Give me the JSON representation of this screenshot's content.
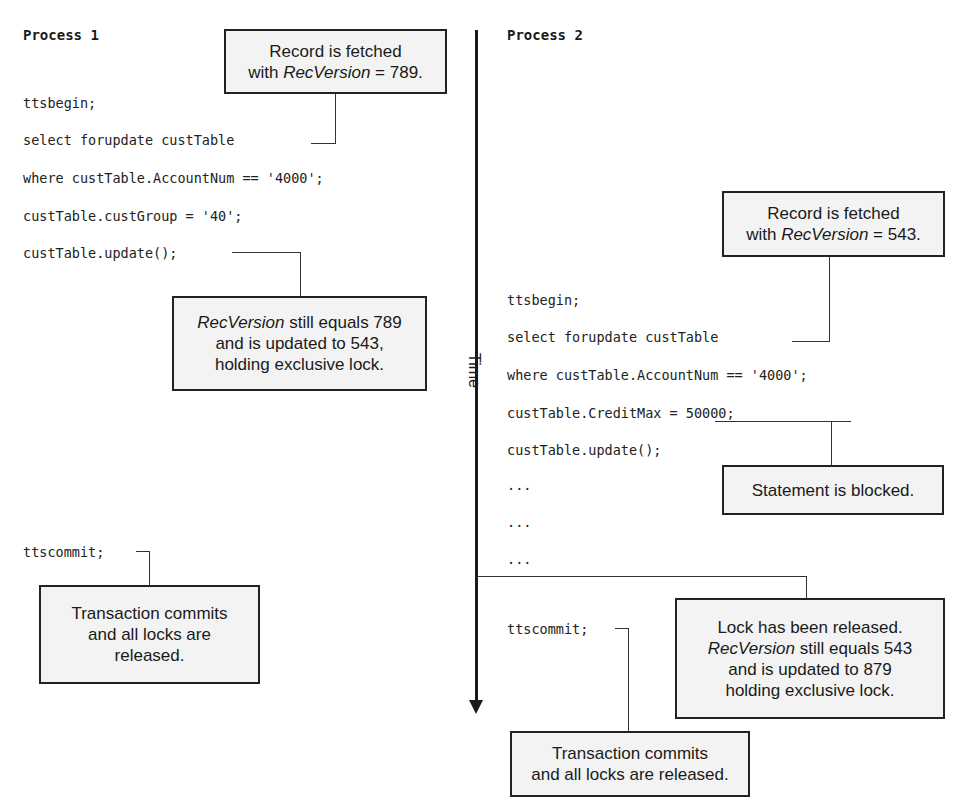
{
  "diagram": {
    "type": "sequence-timeline",
    "time_axis": {
      "label": "Time",
      "direction": "down"
    },
    "process1": {
      "heading": "Process 1",
      "code": [
        "ttsbegin;",
        "select forupdate custTable",
        "where custTable.AccountNum == '4000';",
        "custTable.custGroup = '40';",
        "custTable.update();",
        "ttscommit;"
      ],
      "callouts": {
        "fetched": {
          "line1": "Record is fetched",
          "line2_pre": "with ",
          "line2_em": "RecVersion",
          "line2_post": " = 789."
        },
        "updated": {
          "line1_em": "RecVersion",
          "line1_post": " still equals 789",
          "line2": "and is updated to 543,",
          "line3": "holding exclusive lock."
        },
        "commit": {
          "line1": "Transaction commits",
          "line2": "and all locks are",
          "line3": "released."
        }
      }
    },
    "process2": {
      "heading": "Process 2",
      "code": [
        "ttsbegin;",
        "select forupdate custTable",
        "where custTable.AccountNum == '4000';",
        "custTable.CreditMax = 50000;",
        "custTable.update();",
        "...",
        "...",
        "...",
        "ttscommit;"
      ],
      "callouts": {
        "fetched": {
          "line1": "Record is fetched",
          "line2_pre": "with ",
          "line2_em": "RecVersion",
          "line2_post": " = 543."
        },
        "blocked": {
          "line1": "Statement is blocked."
        },
        "released": {
          "line1": "Lock has been released.",
          "line2_em": "RecVersion",
          "line2_post": " still equals 543",
          "line3": "and is updated to 879",
          "line4": "holding exclusive lock."
        },
        "commit": {
          "line1": "Transaction commits",
          "line2": "and all locks are released."
        }
      }
    }
  }
}
